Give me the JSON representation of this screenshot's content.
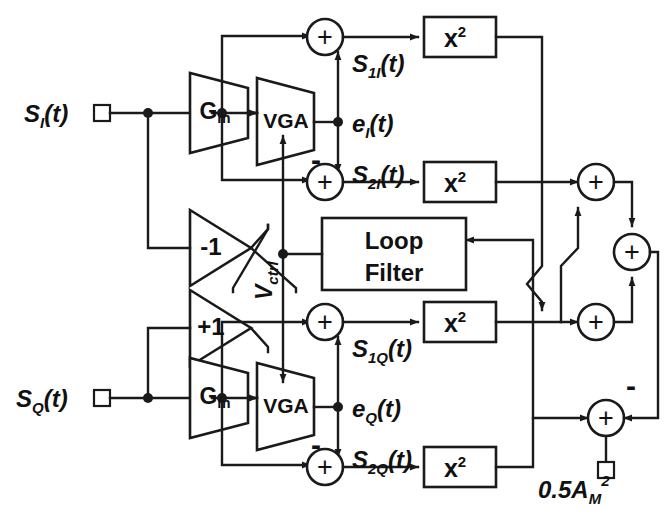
{
  "figure": {
    "kind": "block-diagram",
    "title_visible": false,
    "background_color": "#ffffff",
    "line_color": "#1a1a1a",
    "width": 666,
    "height": 511
  },
  "inputs": [
    {
      "id": "in-i",
      "label_main": "S",
      "label_sub": "I",
      "label_tail": "(t)",
      "x": 85,
      "y": 113
    },
    {
      "id": "in-q",
      "label_main": "S",
      "label_sub": "Q",
      "label_tail": "(t)",
      "x": 85,
      "y": 398
    }
  ],
  "blocks": {
    "gm_i": {
      "label": "G",
      "sub": "m",
      "type": "trapezoid-amplifier"
    },
    "gm_q": {
      "label": "G",
      "sub": "m",
      "type": "trapezoid-amplifier"
    },
    "vga_i": {
      "label": "VGA",
      "type": "trapezoid-amplifier"
    },
    "vga_q": {
      "label": "VGA",
      "type": "trapezoid-amplifier"
    },
    "inv_minus1": {
      "label": "-1",
      "type": "triangle-amplifier"
    },
    "inv_plus1": {
      "label": "+1",
      "type": "triangle-amplifier"
    },
    "loop_filter": {
      "line1": "Loop",
      "line2": "Filter",
      "type": "rect-block"
    },
    "squarers": [
      {
        "id": "sq-1i",
        "base": "x",
        "exp": "2"
      },
      {
        "id": "sq-2i",
        "base": "x",
        "exp": "2"
      },
      {
        "id": "sq-1q",
        "base": "x",
        "exp": "2"
      },
      {
        "id": "sq-2q",
        "base": "x",
        "exp": "2"
      }
    ]
  },
  "adders": [
    {
      "id": "add-1i",
      "symbol": "+",
      "sign_marks": []
    },
    {
      "id": "add-2i",
      "symbol": "+",
      "sign_marks": [
        "-"
      ]
    },
    {
      "id": "add-1q",
      "symbol": "+",
      "sign_marks": []
    },
    {
      "id": "add-2q",
      "symbol": "+",
      "sign_marks": [
        "-"
      ]
    },
    {
      "id": "add-sum-top",
      "symbol": "+",
      "sign_marks": []
    },
    {
      "id": "add-sum-bot",
      "symbol": "+",
      "sign_marks": []
    },
    {
      "id": "add-total",
      "symbol": "+",
      "sign_marks": []
    },
    {
      "id": "add-err",
      "symbol": "+",
      "sign_marks": [
        "-"
      ]
    }
  ],
  "signal_labels": [
    {
      "id": "s1i",
      "main": "S",
      "sub": "1I",
      "tail": "(t)",
      "x": 352,
      "y": 64
    },
    {
      "id": "ei",
      "main": "e",
      "sub": "I",
      "tail": "(t)",
      "x": 352,
      "y": 124
    },
    {
      "id": "s2i",
      "main": "S",
      "sub": "2I",
      "tail": "(t)",
      "x": 352,
      "y": 175
    },
    {
      "id": "s1q",
      "main": "S",
      "sub": "1Q",
      "tail": "(t)",
      "x": 352,
      "y": 348
    },
    {
      "id": "eq",
      "main": "e",
      "sub": "Q",
      "tail": "(t)",
      "x": 352,
      "y": 408
    },
    {
      "id": "s2q",
      "main": "S",
      "sub": "2Q",
      "tail": "(t)",
      "x": 352,
      "y": 459
    }
  ],
  "control_label": {
    "text_main": "V",
    "text_sub": "ctrl",
    "orientation": "vertical"
  },
  "reference_label": {
    "main": "0.5A",
    "sub": "M",
    "sup": "2"
  },
  "minus_marks": [
    {
      "id": "minus-2i",
      "text": "-",
      "x": 316,
      "y": 165
    },
    {
      "id": "minus-2q",
      "text": "-",
      "x": 316,
      "y": 449
    },
    {
      "id": "minus-err",
      "text": "-",
      "x": 631,
      "y": 385
    }
  ]
}
